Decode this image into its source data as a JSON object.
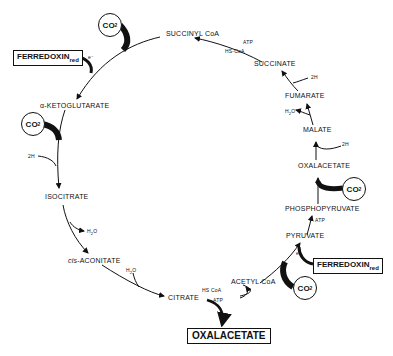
{
  "diagram": {
    "compounds": {
      "succinyl_coa": "SUCCINYL CoA",
      "succinate": "SUCCINATE",
      "fumarate": "FUMARATE",
      "malate": "MALATE",
      "oxalacetate": "OXALACETATE",
      "phosphopyruvate": "PHOSPHOPYRUVATE",
      "pyruvate": "PYRUVATE",
      "acetyl_coa": "ACETYL CoA",
      "citrate": "CITRATE",
      "cis_prefix": "cis",
      "cis_aconitate": "-ACONITATE",
      "isocitrate": "ISOCITRATE",
      "alpha_ketoglutarate": "α-KETOGLUTARATE"
    },
    "cofactors": {
      "atp_1": "ATP",
      "hscoa_1": "HS-CoA",
      "twoh_1": "2H",
      "h2o_fum": "H",
      "h2o_fum_sub": "2",
      "h2o_fum_o": "O",
      "twoh_2": "2H",
      "atp_2": "ATP",
      "hscoa_2": "HS CoA",
      "atp_3": "ATP",
      "h2o_1": "H",
      "h2o_1_sub": "2",
      "h2o_1_o": "O",
      "h2o_2": "H",
      "h2o_2_sub": "2",
      "h2o_2_o": "O",
      "twoh_3": "2H",
      "electron_1": "e⁻",
      "electron_2": "e⁻"
    },
    "inputs": {
      "co2_main": "CO",
      "co2_sub": "2",
      "ferredoxin": "FERREDOXIN",
      "ferredoxin_sub": "red"
    },
    "product": {
      "label": "OXALACETATE"
    }
  }
}
